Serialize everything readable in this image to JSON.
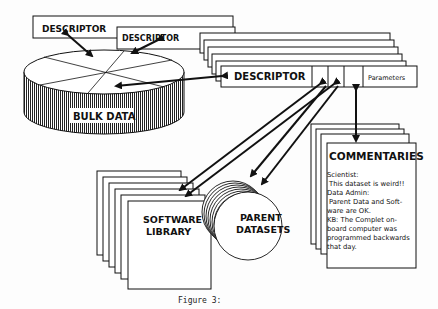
{
  "diagram": {
    "descriptor_top_1": "DESCRIPTOR",
    "descriptor_top_2": "DESCRIPTOR",
    "bulk_data": "BULK DATA",
    "descriptor_main": "DESCRIPTOR",
    "parameters": "Parameters",
    "commentaries": {
      "title": "COMMENTARIES",
      "lines": [
        "Scientist:",
        " This dataset is weird!!",
        "Data Admin:",
        " Parent Data and Soft-",
        "ware are OK.",
        "KB:  The Complet on-",
        "board computer was",
        "programmed backwards",
        "that day."
      ]
    },
    "software_library": [
      "SOFTWARE",
      "LIBRARY"
    ],
    "parent_datasets": [
      "PARENT",
      "DATASETS"
    ]
  },
  "caption": "Figure 3:",
  "colors": {
    "ink": "#111111",
    "paper": "#fdfdfd"
  }
}
